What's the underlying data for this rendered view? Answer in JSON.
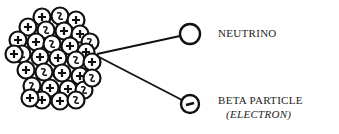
{
  "diagram": {
    "nucleus": {
      "label": "nucleus",
      "particle_count": 36
    },
    "particles": [
      {
        "name": "neutrino",
        "label": "NEUTRINO",
        "charge_symbol": ""
      },
      {
        "name": "beta-particle",
        "label": "BETA PARTICLE",
        "sublabel": "(ELECTRON)",
        "charge_symbol": "−"
      }
    ],
    "colors": {
      "ink": "#111111",
      "background": "#ffffff"
    }
  }
}
